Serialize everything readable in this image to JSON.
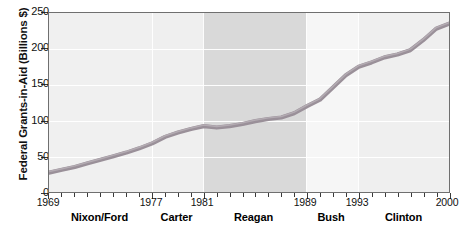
{
  "chart_data": {
    "type": "line",
    "title": "",
    "xlabel": "",
    "ylabel": "Federal Grants-in-Aid (Billions $)",
    "ylim": [
      0,
      250
    ],
    "xlim": [
      1969,
      2000
    ],
    "yticks": [
      0,
      50,
      100,
      150,
      200,
      250
    ],
    "ytick_labels": [
      "0",
      "50",
      "100",
      "150",
      "200",
      "250"
    ],
    "xtick_labels": [
      "1969",
      "1977",
      "1981",
      "1989",
      "1993",
      "2000"
    ],
    "xtick_years": [
      1969,
      1977,
      1981,
      1989,
      1993,
      2000
    ],
    "grid": "horizontal",
    "legend": "none",
    "line_color": "#9a9099",
    "x": [
      1969,
      1970,
      1971,
      1972,
      1973,
      1974,
      1975,
      1976,
      1977,
      1978,
      1979,
      1980,
      1981,
      1982,
      1983,
      1984,
      1985,
      1986,
      1987,
      1988,
      1989,
      1990,
      1991,
      1992,
      1993,
      1994,
      1995,
      1996,
      1997,
      1998,
      1999,
      2000
    ],
    "values": [
      27,
      31,
      35,
      40,
      45,
      50,
      55,
      61,
      68,
      77,
      83,
      88,
      92,
      90,
      92,
      95,
      99,
      102,
      104,
      110,
      120,
      129,
      146,
      163,
      175,
      181,
      188,
      192,
      198,
      212,
      228,
      235
    ],
    "annotations": [
      {
        "label": "Nixon/Ford",
        "start": 1969,
        "end": 1977,
        "shade": "light"
      },
      {
        "label": "Carter",
        "start": 1977,
        "end": 1981,
        "shade": "light"
      },
      {
        "label": "Reagan",
        "start": 1981,
        "end": 1989,
        "shade": "dark"
      },
      {
        "label": "Bush",
        "start": 1989,
        "end": 1993,
        "shade": "lighter"
      },
      {
        "label": "Clinton",
        "start": 1993,
        "end": 2000,
        "shade": "light"
      }
    ]
  },
  "axes": {
    "y_title": "Federal Grants-in-Aid (Billions $)",
    "y_labels": [
      "250",
      "200",
      "150",
      "100",
      "50",
      "0"
    ],
    "x_labels": [
      "1969",
      "1977",
      "1981",
      "1989",
      "1993",
      "2000"
    ]
  },
  "eras": {
    "items": [
      {
        "label": "Nixon/Ford"
      },
      {
        "label": "Carter"
      },
      {
        "label": "Reagan"
      },
      {
        "label": "Bush"
      },
      {
        "label": "Clinton"
      }
    ]
  },
  "colors": {
    "line": "#9a9099",
    "line_edge": "#7d747c",
    "band_light": "#f0f0f0",
    "band_lighter": "#f6f6f6",
    "band_dark": "#d9d9d9",
    "frame": "#6f6f6f"
  }
}
